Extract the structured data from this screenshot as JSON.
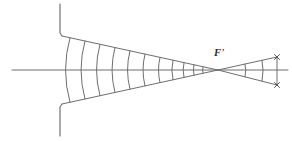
{
  "figure": {
    "kind": "optics-ray-diagram",
    "width": 292,
    "height": 141,
    "background_color": "#ffffff",
    "stroke_color": "#6e6e6e",
    "stroke_color_dark": "#555555",
    "label_color": "#2a2a2a",
    "stroke_width": 1
  },
  "labels": {
    "focal_point": "F'"
  },
  "chart_data": {
    "type": "scatter",
    "xlabel": "",
    "ylabel": "",
    "xlim": [
      0,
      292
    ],
    "ylim": [
      0,
      141
    ],
    "grid": false,
    "legend": null,
    "annotations": [
      {
        "text": "F'",
        "x": 214,
        "y": 56
      }
    ],
    "points": [
      {
        "name": "focal-point",
        "x": 218,
        "y": 70
      },
      {
        "name": "aperture-top-edge",
        "x": 62,
        "y": 36
      },
      {
        "name": "aperture-bottom-edge",
        "x": 62,
        "y": 104
      },
      {
        "name": "screen-top-end",
        "x": 277,
        "y": 57
      },
      {
        "name": "screen-bottom-end",
        "x": 277,
        "y": 85
      }
    ],
    "series": [
      {
        "name": "optical-axis",
        "kind": "line",
        "x": [
          12,
          288
        ],
        "y": [
          70,
          70
        ]
      },
      {
        "name": "aperture-stop-upper",
        "kind": "polyline",
        "x": [
          60,
          60,
          62
        ],
        "y": [
          4,
          33,
          36
        ]
      },
      {
        "name": "aperture-stop-lower",
        "kind": "polyline",
        "x": [
          60,
          60,
          62
        ],
        "y": [
          136,
          107,
          104
        ]
      },
      {
        "name": "cone-upper-marginal-ray",
        "kind": "line",
        "x": [
          62,
          218
        ],
        "y": [
          36,
          70
        ]
      },
      {
        "name": "cone-lower-marginal-ray",
        "kind": "line",
        "x": [
          62,
          218
        ],
        "y": [
          104,
          70
        ]
      },
      {
        "name": "diverging-upper-ray",
        "kind": "line",
        "x": [
          218,
          277
        ],
        "y": [
          70,
          57
        ]
      },
      {
        "name": "diverging-lower-ray",
        "kind": "line",
        "x": [
          218,
          277
        ],
        "y": [
          70,
          85
        ]
      },
      {
        "name": "screen-line",
        "kind": "line",
        "x": [
          277,
          277
        ],
        "y": [
          57,
          85
        ]
      }
    ],
    "wavefronts_converging": [
      {
        "index": 1,
        "axis_x": 70,
        "curvature": 9
      },
      {
        "index": 2,
        "axis_x": 85,
        "curvature": 8
      },
      {
        "index": 3,
        "axis_x": 100,
        "curvature": 7
      },
      {
        "index": 4,
        "axis_x": 115,
        "curvature": 6
      },
      {
        "index": 5,
        "axis_x": 130,
        "curvature": 5
      },
      {
        "index": 6,
        "axis_x": 145,
        "curvature": 4
      },
      {
        "index": 7,
        "axis_x": 160,
        "curvature": 3
      },
      {
        "index": 8,
        "axis_x": 173,
        "curvature": 2.4
      },
      {
        "index": 9,
        "axis_x": 184,
        "curvature": 1.8
      },
      {
        "index": 10,
        "axis_x": 194,
        "curvature": 1.2
      },
      {
        "index": 11,
        "axis_x": 203,
        "curvature": 0.8
      }
    ],
    "wavefronts_diverging": [
      {
        "index": 1,
        "axis_x": 245,
        "curvature": -1.5
      },
      {
        "index": 2,
        "axis_x": 262,
        "curvature": -2.2
      }
    ]
  }
}
